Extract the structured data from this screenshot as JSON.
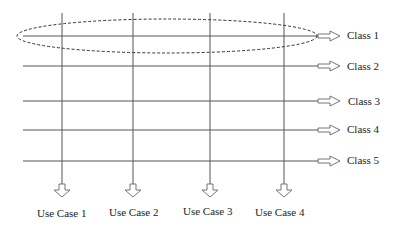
{
  "diagram": {
    "type": "traceability-grid",
    "classes": [
      {
        "label": "Class 1",
        "y": 36,
        "label_x": 347
      },
      {
        "label": "Class 2",
        "y": 66,
        "label_x": 347
      },
      {
        "label": "Class 3",
        "y": 101,
        "label_x": 348
      },
      {
        "label": "Class 4",
        "y": 130,
        "label_x": 347
      },
      {
        "label": "Class 5",
        "y": 161,
        "label_x": 347
      }
    ],
    "use_cases": [
      {
        "label": "Use Case 1",
        "x": 62,
        "label_x": 37
      },
      {
        "label": "Use Case 2",
        "x": 133,
        "label_x": 109
      },
      {
        "label": "Use Case 3",
        "x": 210,
        "label_x": 183
      },
      {
        "label": "Use Case 4",
        "x": 284,
        "label_x": 255
      }
    ],
    "highlight": {
      "shape": "dashed-ellipse",
      "around": "Class 1"
    },
    "colors": {
      "line": "#555555",
      "arrow": "#666666",
      "text": "#222222"
    }
  }
}
